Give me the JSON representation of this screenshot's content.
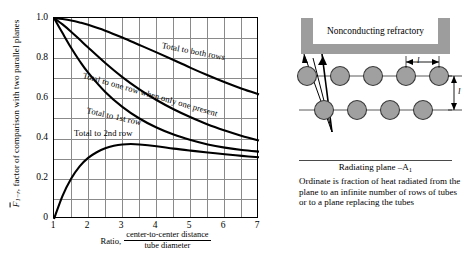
{
  "chart_data": {
    "type": "line",
    "title": "",
    "xlabel_prefix": "Ratio,",
    "xlabel_numerator": "center-to-center distance",
    "xlabel_denominator": "tube diameter",
    "ylabel": "F̃1−r, factor of comparison with two parallel planes",
    "ylabel_symbol": "F",
    "ylabel_subscript": "1−r",
    "ylabel_rest": ", factor of comparison with two parallel planes",
    "xlim": [
      1,
      7
    ],
    "ylim": [
      0,
      1.0
    ],
    "xticks": [
      1,
      2,
      3,
      4,
      5,
      6,
      7
    ],
    "xticklabels": [
      "1",
      "2",
      "3",
      "4",
      "5",
      "6",
      "7"
    ],
    "yticks": [
      0,
      0.2,
      0.4,
      0.6,
      0.8,
      1.0
    ],
    "yticklabels": [
      "0",
      "0.2",
      "0.4",
      "0.6",
      "0.8",
      "1.0"
    ],
    "grid": true,
    "grid_x_minor_step": 0.5,
    "grid_y_minor_step": 0.1,
    "legend": "inline-labels",
    "series": [
      {
        "name": "Total to both rows",
        "label": "Total to both rows",
        "x": [
          1,
          1.25,
          1.5,
          1.75,
          2,
          2.5,
          3,
          3.5,
          4,
          4.5,
          5,
          5.5,
          6,
          6.5,
          7
        ],
        "values": [
          1.0,
          0.995,
          0.988,
          0.978,
          0.966,
          0.937,
          0.903,
          0.866,
          0.829,
          0.791,
          0.752,
          0.715,
          0.68,
          0.648,
          0.62
        ]
      },
      {
        "name": "Total to one row when only one present",
        "label": "Total to one row when only one present",
        "x": [
          1,
          1.25,
          1.5,
          1.75,
          2,
          2.5,
          3,
          3.5,
          4,
          4.5,
          5,
          5.5,
          6,
          6.5,
          7
        ],
        "values": [
          1.0,
          0.968,
          0.932,
          0.893,
          0.853,
          0.776,
          0.706,
          0.645,
          0.592,
          0.546,
          0.506,
          0.47,
          0.44,
          0.413,
          0.39
        ]
      },
      {
        "name": "Total to 1st row",
        "label": "Total to 1st row",
        "x": [
          1,
          1.25,
          1.5,
          1.75,
          2,
          2.5,
          3,
          3.5,
          4,
          4.5,
          5,
          5.5,
          6,
          6.5,
          7
        ],
        "values": [
          1.0,
          0.925,
          0.852,
          0.786,
          0.728,
          0.632,
          0.558,
          0.5,
          0.455,
          0.42,
          0.393,
          0.371,
          0.355,
          0.343,
          0.335
        ]
      },
      {
        "name": "Total to 2nd row",
        "label": "Total to 2nd row",
        "x": [
          1,
          1.25,
          1.5,
          1.75,
          2,
          2.25,
          2.5,
          2.75,
          3,
          3.25,
          3.5,
          4,
          4.5,
          5,
          5.5,
          6,
          6.5,
          7
        ],
        "values": [
          0.0,
          0.115,
          0.2,
          0.262,
          0.304,
          0.332,
          0.352,
          0.364,
          0.371,
          0.373,
          0.371,
          0.362,
          0.35,
          0.34,
          0.331,
          0.322,
          0.314,
          0.307
        ]
      }
    ]
  },
  "diagram": {
    "refractory_label": "Nonconducting refractory",
    "plane_label": "Radiating plane –A",
    "plane_label_subscript": "1",
    "horizontal_spacing_symbol": "l",
    "vertical_spacing_symbol": "l",
    "caption": "Ordinate is fraction of heat radiated from the plane to an infinite number of rows of tubes or to a plane replacing the tubes",
    "tube_rows": [
      {
        "count": 5,
        "offset": "aligned"
      },
      {
        "count": 4,
        "offset": "staggered"
      }
    ],
    "colors": {
      "refractory_fill": "#9d9d9d",
      "tube_fill": "#a0a0a0",
      "tube_stroke": "#3a3a3a",
      "curve": "#000000",
      "grid": "#8a8a8a"
    }
  }
}
